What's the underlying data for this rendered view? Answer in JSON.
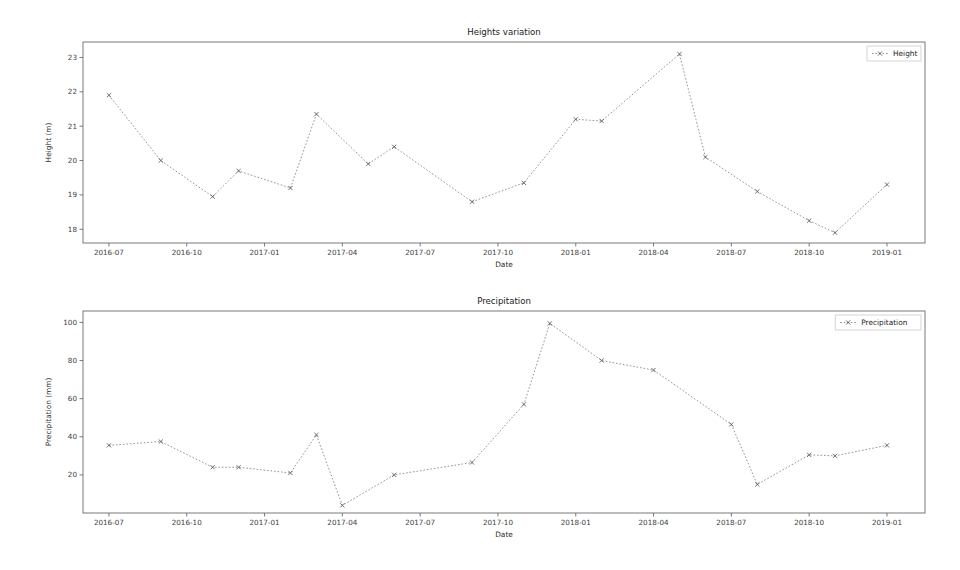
{
  "figure": {
    "width": 960,
    "height": 570,
    "background": "#ffffff",
    "line_color": "#7f7f8a",
    "marker_color": "#55555f",
    "axis_color": "#6b6b6b"
  },
  "chart_data": [
    {
      "type": "line",
      "title": "Heights variation",
      "xlabel": "Date",
      "ylabel": "Height (m)",
      "legend": [
        "Height"
      ],
      "legend_position": "upper right",
      "grid": false,
      "marker": "x",
      "linestyle": "dotted",
      "xlim": [
        "2016-06-01",
        "2019-02-15"
      ],
      "ylim": [
        17.6,
        23.45
      ],
      "yticks": [
        18,
        19,
        20,
        21,
        22,
        23
      ],
      "ytick_labels": [
        "18",
        "19",
        "20",
        "21",
        "22",
        "23"
      ],
      "xticks": [
        "2016-07",
        "2016-10",
        "2017-01",
        "2017-04",
        "2017-07",
        "2017-10",
        "2018-01",
        "2018-04",
        "2018-07",
        "2018-10",
        "2019-01"
      ],
      "xtick_labels": [
        "2016-07",
        "2016-10",
        "2017-01",
        "2017-04",
        "2017-07",
        "2017-10",
        "2018-01",
        "2018-04",
        "2018-07",
        "2018-10",
        "2019-01"
      ],
      "x": [
        "2016-07",
        "2016-09",
        "2016-11",
        "2016-12",
        "2017-02",
        "2017-03",
        "2017-05",
        "2017-06",
        "2017-09",
        "2017-11",
        "2018-01",
        "2018-02",
        "2018-05",
        "2018-06",
        "2018-08",
        "2018-10",
        "2018-11",
        "2019-01"
      ],
      "values": [
        21.9,
        20.0,
        18.95,
        19.7,
        19.2,
        21.35,
        19.9,
        20.4,
        18.8,
        19.35,
        21.2,
        21.15,
        23.1,
        20.1,
        19.1,
        18.25,
        17.9,
        19.3
      ],
      "series": [
        {
          "name": "Height",
          "values": [
            21.9,
            20.0,
            18.95,
            19.7,
            19.2,
            21.35,
            19.9,
            20.4,
            18.8,
            19.35,
            21.2,
            21.15,
            23.1,
            20.1,
            19.1,
            18.25,
            17.9,
            19.3
          ]
        }
      ]
    },
    {
      "type": "line",
      "title": "Precipitation",
      "xlabel": "Date",
      "ylabel": "Precipitation (mm)",
      "legend": [
        "Precipitation"
      ],
      "legend_position": "upper right",
      "grid": false,
      "marker": "x",
      "linestyle": "dotted",
      "xlim": [
        "2016-06-01",
        "2019-02-15"
      ],
      "ylim": [
        0,
        106
      ],
      "yticks": [
        20,
        40,
        60,
        80,
        100
      ],
      "ytick_labels": [
        "20",
        "40",
        "60",
        "80",
        "100"
      ],
      "xticks": [
        "2016-07",
        "2016-10",
        "2017-01",
        "2017-04",
        "2017-07",
        "2017-10",
        "2018-01",
        "2018-04",
        "2018-07",
        "2018-10",
        "2019-01"
      ],
      "xtick_labels": [
        "2016-07",
        "2016-10",
        "2017-01",
        "2017-04",
        "2017-07",
        "2017-10",
        "2018-01",
        "2018-04",
        "2018-07",
        "2018-10",
        "2019-01"
      ],
      "x": [
        "2016-07",
        "2016-09",
        "2016-11",
        "2016-12",
        "2017-02",
        "2017-03",
        "2017-04",
        "2017-06",
        "2017-09",
        "2017-11",
        "2017-12",
        "2018-02",
        "2018-04",
        "2018-07",
        "2018-08",
        "2018-10",
        "2018-11",
        "2019-01"
      ],
      "values": [
        35.5,
        37.5,
        24.0,
        24.0,
        21.0,
        41.0,
        4.0,
        20.0,
        26.5,
        57.0,
        99.5,
        80.0,
        75.0,
        46.5,
        15.0,
        30.5,
        30.0,
        35.5
      ],
      "series": [
        {
          "name": "Precipitation",
          "values": [
            35.5,
            37.5,
            24.0,
            24.0,
            21.0,
            41.0,
            4.0,
            20.0,
            26.5,
            57.0,
            99.5,
            80.0,
            75.0,
            46.5,
            15.0,
            30.5,
            30.0,
            35.5
          ]
        }
      ]
    }
  ]
}
